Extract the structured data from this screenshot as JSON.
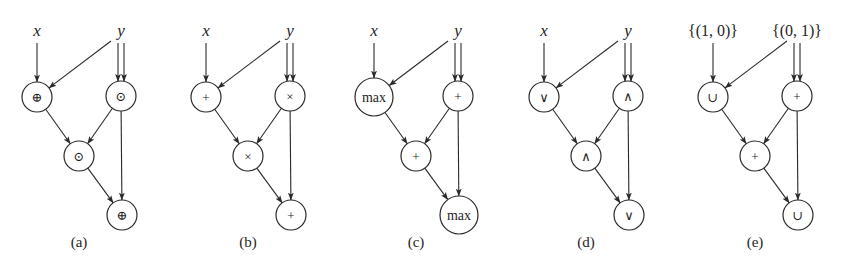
{
  "figure": {
    "panels": [
      {
        "caption": "(a)",
        "offset_x": 0,
        "inputs": [
          {
            "id": "in1",
            "label": "x",
            "style": "var"
          },
          {
            "id": "in2",
            "label": "y",
            "style": "var"
          }
        ],
        "nodes": [
          {
            "id": "n1",
            "op": "⊕",
            "kind": "sym"
          },
          {
            "id": "n2",
            "op": "⊙",
            "kind": "sym"
          },
          {
            "id": "n3",
            "op": "⊙",
            "kind": "sym"
          },
          {
            "id": "n4",
            "op": "⊕",
            "kind": "sym"
          }
        ]
      },
      {
        "caption": "(b)",
        "offset_x": 169,
        "inputs": [
          {
            "id": "in1",
            "label": "x",
            "style": "var"
          },
          {
            "id": "in2",
            "label": "y",
            "style": "var"
          }
        ],
        "nodes": [
          {
            "id": "n1",
            "op": "+",
            "kind": "sym"
          },
          {
            "id": "n2",
            "op": "×",
            "kind": "sym"
          },
          {
            "id": "n3",
            "op": "×",
            "kind": "sym"
          },
          {
            "id": "n4",
            "op": "+",
            "kind": "sym"
          }
        ]
      },
      {
        "caption": "(c)",
        "offset_x": 337,
        "inputs": [
          {
            "id": "in1",
            "label": "x",
            "style": "var"
          },
          {
            "id": "in2",
            "label": "y",
            "style": "var"
          }
        ],
        "nodes": [
          {
            "id": "n1",
            "op": "max",
            "kind": "word"
          },
          {
            "id": "n2",
            "op": "+",
            "kind": "sym"
          },
          {
            "id": "n3",
            "op": "+",
            "kind": "sym"
          },
          {
            "id": "n4",
            "op": "max",
            "kind": "word"
          }
        ]
      },
      {
        "caption": "(d)",
        "offset_x": 507,
        "inputs": [
          {
            "id": "in1",
            "label": "x",
            "style": "var"
          },
          {
            "id": "in2",
            "label": "y",
            "style": "var"
          }
        ],
        "nodes": [
          {
            "id": "n1",
            "op": "∨",
            "kind": "sym"
          },
          {
            "id": "n2",
            "op": "∧",
            "kind": "sym"
          },
          {
            "id": "n3",
            "op": "∧",
            "kind": "sym"
          },
          {
            "id": "n4",
            "op": "∨",
            "kind": "sym"
          }
        ]
      },
      {
        "caption": "(e)",
        "offset_x": 676,
        "inputs": [
          {
            "id": "in1",
            "label": "{(1, 0)}",
            "style": "set"
          },
          {
            "id": "in2",
            "label": "{(0, 1)}",
            "style": "set"
          }
        ],
        "nodes": [
          {
            "id": "n1",
            "op": "∪",
            "kind": "sym"
          },
          {
            "id": "n2",
            "op": "+",
            "kind": "sym"
          },
          {
            "id": "n3",
            "op": "+",
            "kind": "sym"
          },
          {
            "id": "n4",
            "op": "∪",
            "kind": "sym"
          }
        ]
      }
    ],
    "edges": [
      {
        "from": "in1",
        "to": "n1"
      },
      {
        "from": "in2",
        "to": "n1"
      },
      {
        "from": "in2",
        "to": "n2",
        "double": true
      },
      {
        "from": "n1",
        "to": "n3"
      },
      {
        "from": "n2",
        "to": "n3"
      },
      {
        "from": "n3",
        "to": "n4"
      },
      {
        "from": "n2",
        "to": "n4"
      }
    ]
  }
}
